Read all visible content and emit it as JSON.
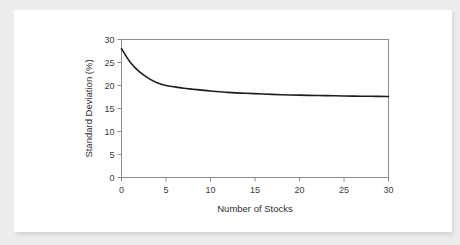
{
  "card": {
    "background_color": "#ffffff",
    "page_background_color": "#ededed"
  },
  "chart_data": {
    "type": "line",
    "title": "",
    "subtitle": "",
    "xlabel": "Number of Stocks",
    "ylabel": "Standard Deviation (%)",
    "xlim": [
      0,
      30
    ],
    "ylim": [
      0,
      30
    ],
    "xticks": [
      "0",
      "5",
      "10",
      "15",
      "20",
      "25",
      "30"
    ],
    "xtick_values": [
      0,
      5,
      10,
      15,
      20,
      25,
      30
    ],
    "yticks": [
      "0",
      "5",
      "10",
      "15",
      "20",
      "25",
      "30"
    ],
    "ytick_values": [
      0,
      5,
      10,
      15,
      20,
      25,
      30
    ],
    "grid": false,
    "legend": false,
    "legend_position": "none",
    "line_color": "#1d1d1d",
    "frame_color": "#8c8c8c",
    "series": [
      {
        "name": "Portfolio standard deviation",
        "x": [
          0,
          1,
          2,
          3,
          4,
          5,
          6,
          7,
          8,
          9,
          10,
          12,
          14,
          16,
          18,
          20,
          22,
          24,
          26,
          28,
          30
        ],
        "values": [
          28.0,
          25.0,
          23.0,
          21.6,
          20.6,
          20.0,
          19.7,
          19.4,
          19.2,
          19.0,
          18.8,
          18.5,
          18.3,
          18.15,
          18.0,
          17.9,
          17.82,
          17.76,
          17.7,
          17.66,
          17.62
        ]
      }
    ]
  }
}
